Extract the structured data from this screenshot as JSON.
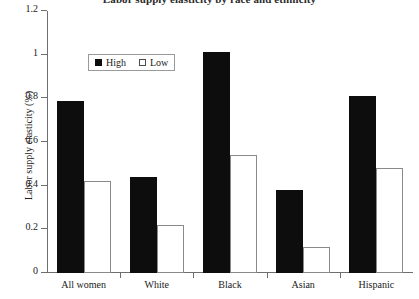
{
  "chart_data": {
    "type": "bar",
    "title": "Labor supply elasticity by race and ethnicity",
    "xlabel": "",
    "ylabel": "Labor supply elasticity (%)",
    "ylim": [
      0,
      1.2
    ],
    "yticks": [
      "0",
      "0.2",
      "0.4",
      "0.6",
      "0.8",
      "1",
      "1.2"
    ],
    "ytick_values": [
      0,
      0.2,
      0.4,
      0.6,
      0.8,
      1,
      1.2
    ],
    "grid": false,
    "legend_position": "upper-left-inside",
    "categories": [
      "All women",
      "White",
      "Black",
      "Asian",
      "Hispanic"
    ],
    "series": [
      {
        "name": "High",
        "color": "#0d0d0d",
        "style": "filled",
        "values": [
          0.79,
          0.44,
          1.01,
          0.38,
          0.81
        ]
      },
      {
        "name": "Low",
        "color": "#ffffff",
        "style": "hollow",
        "values": [
          0.42,
          0.22,
          0.54,
          0.12,
          0.48
        ]
      }
    ]
  },
  "legend": {
    "entries": [
      {
        "label": "High",
        "swatch": "filled-square-icon"
      },
      {
        "label": "Low",
        "swatch": "hollow-square-icon"
      }
    ]
  }
}
